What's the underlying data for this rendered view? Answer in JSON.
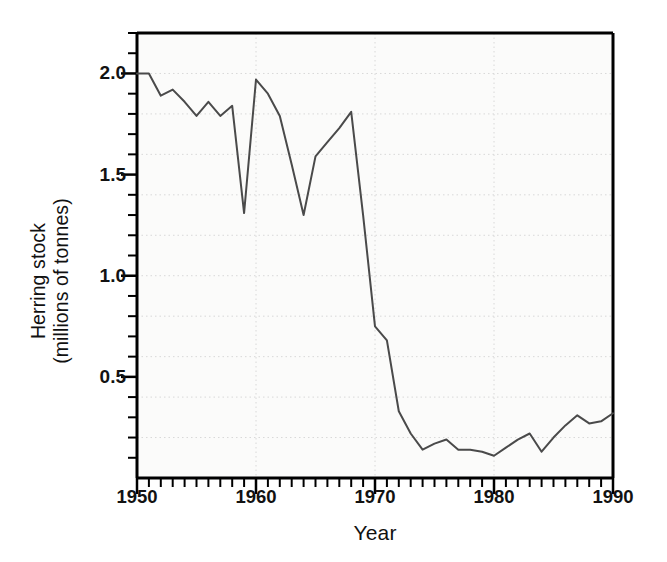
{
  "chart_data": {
    "type": "line",
    "title": "",
    "xlabel": "Year",
    "ylabel": "Herring stock (millions of tonnes)",
    "ylabel_lines": [
      "Herring stock",
      "(millions of tonnes)"
    ],
    "xlim": [
      1950,
      1990
    ],
    "ylim": [
      0.0,
      2.2
    ],
    "grid": true,
    "grid_style": "dotted",
    "legend": "none",
    "x_major_ticks": [
      1950,
      1960,
      1970,
      1980,
      1990
    ],
    "x_major_tick_labels": [
      "1950",
      "1960",
      "1970",
      "1980",
      "1990"
    ],
    "x_minor_tick_interval": 1,
    "y_major_ticks": [
      0.5,
      1.0,
      1.5,
      2.0
    ],
    "y_major_tick_labels": [
      "0.5",
      "1.0",
      "1.5",
      "2.0"
    ],
    "y_minor_tick_interval": 0.1,
    "line_color": "#4a4a4a",
    "line_width": 2,
    "plot_background": "#fbfbfa",
    "axis_color": "#000000",
    "grid_color": "#d8d8d8",
    "x": [
      1950,
      1951,
      1952,
      1953,
      1954,
      1955,
      1956,
      1957,
      1958,
      1959,
      1960,
      1961,
      1962,
      1963,
      1964,
      1965,
      1966,
      1967,
      1968,
      1969,
      1970,
      1971,
      1972,
      1973,
      1974,
      1975,
      1976,
      1977,
      1978,
      1979,
      1980,
      1981,
      1982,
      1983,
      1984,
      1985,
      1986,
      1987,
      1988,
      1989,
      1990
    ],
    "values": [
      2.0,
      2.0,
      1.89,
      1.92,
      1.86,
      1.79,
      1.86,
      1.79,
      1.84,
      1.31,
      1.97,
      1.9,
      1.79,
      1.55,
      1.3,
      1.59,
      1.66,
      1.73,
      1.81,
      1.3,
      0.75,
      0.68,
      0.33,
      0.22,
      0.14,
      0.17,
      0.19,
      0.14,
      0.14,
      0.13,
      0.11,
      0.15,
      0.19,
      0.22,
      0.13,
      0.2,
      0.26,
      0.31,
      0.27,
      0.28,
      0.32
    ]
  },
  "axes": {
    "y_title_line1": "Herring stock",
    "y_title_line2": "(millions of tonnes)",
    "x_title": "Year"
  }
}
